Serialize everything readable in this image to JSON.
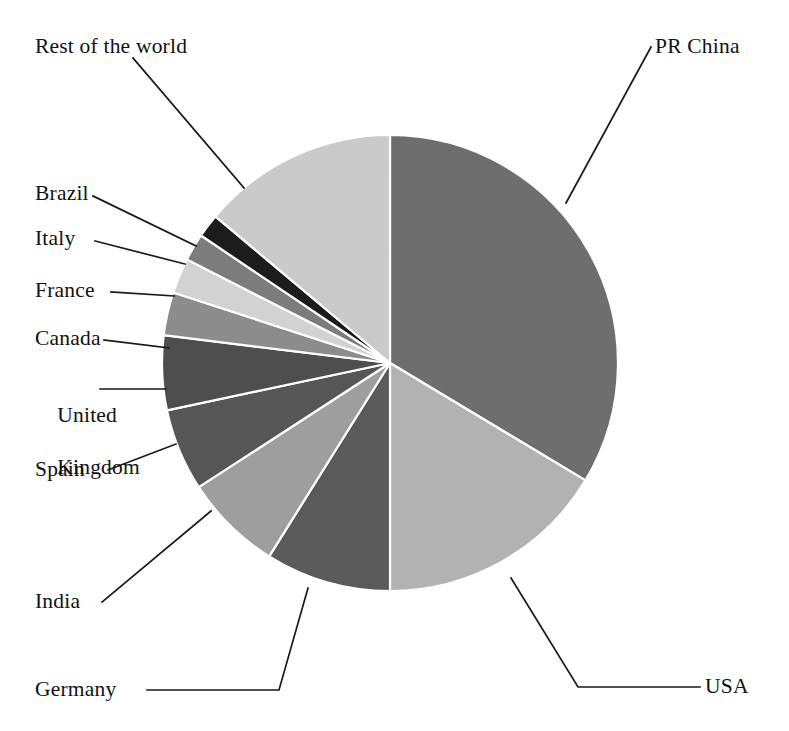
{
  "figure": {
    "background_color": "#ffffff",
    "width": 789,
    "height": 731
  },
  "chart_data": {
    "type": "pie",
    "title": "",
    "subtitle": "",
    "xlabel": "",
    "ylabel": "",
    "grid": false,
    "legend_position": "none",
    "label_style": "leader-line callouts",
    "start_angle_deg": 0,
    "direction": "clockwise",
    "center": {
      "x": 390,
      "y": 363
    },
    "radius": 228,
    "categories": [
      "PR China",
      "USA",
      "Germany",
      "India",
      "Spain",
      "United Kingdom",
      "Canada",
      "France",
      "Italy",
      "Brazil",
      "Rest of the world"
    ],
    "values": [
      33.6,
      16.4,
      8.9,
      6.9,
      5.8,
      5.3,
      3.1,
      2.5,
      1.9,
      1.7,
      13.9
    ],
    "colors": [
      "#6e6e6e",
      "#b2b2b2",
      "#5a5a5a",
      "#9e9e9e",
      "#565656",
      "#4e4e4e",
      "#8c8c8c",
      "#d2d2d2",
      "#7c7c7c",
      "#1c1c1c",
      "#cacaca"
    ],
    "slices": [
      {
        "label": "PR China",
        "value": 33.6,
        "start_deg": 0.0,
        "end_deg": 121.0,
        "color": "#6e6e6e"
      },
      {
        "label": "USA",
        "value": 16.4,
        "start_deg": 121.0,
        "end_deg": 180.0,
        "color": "#b2b2b2"
      },
      {
        "label": "Germany",
        "value": 8.9,
        "start_deg": 180.0,
        "end_deg": 212.0,
        "color": "#5a5a5a"
      },
      {
        "label": "India",
        "value": 6.9,
        "start_deg": 212.0,
        "end_deg": 237.0,
        "color": "#9e9e9e"
      },
      {
        "label": "Spain",
        "value": 5.8,
        "start_deg": 237.0,
        "end_deg": 258.0,
        "color": "#565656"
      },
      {
        "label": "United Kingdom",
        "value": 5.3,
        "start_deg": 258.0,
        "end_deg": 277.0,
        "color": "#4e4e4e"
      },
      {
        "label": "Canada",
        "value": 3.1,
        "start_deg": 277.0,
        "end_deg": 288.0,
        "color": "#8c8c8c"
      },
      {
        "label": "France",
        "value": 2.5,
        "start_deg": 288.0,
        "end_deg": 297.0,
        "color": "#d2d2d2"
      },
      {
        "label": "Italy",
        "value": 1.9,
        "start_deg": 297.0,
        "end_deg": 304.0,
        "color": "#7c7c7c"
      },
      {
        "label": "Brazil",
        "value": 1.7,
        "start_deg": 304.0,
        "end_deg": 310.0,
        "color": "#1c1c1c"
      },
      {
        "label": "Rest of the world",
        "value": 13.9,
        "start_deg": 310.0,
        "end_deg": 360.0,
        "color": "#cacaca"
      }
    ]
  },
  "labels": {
    "pr_china": "PR China",
    "usa": "USA",
    "germany": "Germany",
    "india": "India",
    "spain": "Spain",
    "united_kingdom_line1": "United",
    "united_kingdom_line2": "Kingdom",
    "canada": "Canada",
    "france": "France",
    "italy": "Italy",
    "brazil": "Brazil",
    "rest_of_the_world": "Rest of the world"
  }
}
